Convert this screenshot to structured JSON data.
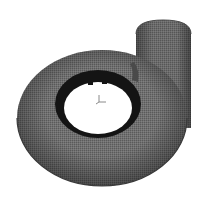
{
  "figure": {
    "colors": {
      "background": "#ffffff",
      "mesh_body": "#6e6e6e",
      "mesh_dark": "#3a3a3a",
      "inner_ring": "#141414",
      "hole": "#ffffff",
      "axis_triad": "#8a8a8a"
    },
    "parts": [
      "volute-torus",
      "outlet-pipe",
      "inner-ring",
      "central-opening",
      "axis-triad"
    ]
  }
}
